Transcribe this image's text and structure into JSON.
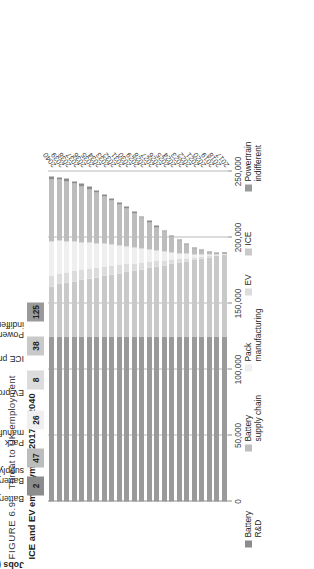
{
  "figure": {
    "number": "FIGURE 6.9",
    "title": "Threat to UK employment",
    "subtitle": "ICE and EV employment 2017 to 2040"
  },
  "value_header": "Jobs (000s) in 2040",
  "value_boxes": [
    {
      "label": "Battery R&D",
      "value": "2",
      "color": "#8c8c8c"
    },
    {
      "label": "Battery supply chain",
      "value": "47",
      "color": "#bdbdbd"
    },
    {
      "label": "Pack manufacturing",
      "value": "26",
      "color": "#efefef"
    },
    {
      "label": "EV production",
      "value": "8",
      "color": "#dcdcdc"
    },
    {
      "label": "ICE production",
      "value": "38",
      "color": "#c9c9c9"
    },
    {
      "label": "Powertrain indifferent",
      "value": "125",
      "color": "#9a9a9a"
    }
  ],
  "legend": [
    {
      "label": "Battery\nR&D",
      "color": "#8c8c8c"
    },
    {
      "label": "Battery\nsupply chain",
      "color": "#bdbdbd"
    },
    {
      "label": "Pack\nmanufacturing",
      "color": "#efefef"
    },
    {
      "label": "EV",
      "color": "#dcdcdc"
    },
    {
      "label": "ICE",
      "color": "#c9c9c9"
    },
    {
      "label": "Powertrain\nindifferent",
      "color": "#9a9a9a"
    }
  ],
  "chart_data": {
    "type": "bar",
    "orientation": "horizontal-stacked",
    "title": "ICE and EV employment 2017 to 2040",
    "xlabel": "",
    "ylabel": "",
    "ylim": [
      0,
      250000
    ],
    "yticks": [
      "0",
      "50,000",
      "100,000",
      "150,000",
      "200,000",
      "250,000"
    ],
    "ytick_values": [
      0,
      50000,
      100000,
      150000,
      200000,
      250000
    ],
    "grid": true,
    "legend_position": "bottom",
    "categories": [
      "2017",
      "2018",
      "2019",
      "2020",
      "2021",
      "2022",
      "2023",
      "2024",
      "2025",
      "2026",
      "2027",
      "2028",
      "2029",
      "2030",
      "2031",
      "2032",
      "2033",
      "2034",
      "2035",
      "2036",
      "2037",
      "2038",
      "2039",
      "2040"
    ],
    "series": [
      {
        "name": "Powertrain indifferent",
        "color": "#9a9a9a",
        "values": [
          125000,
          125000,
          125000,
          125000,
          125000,
          125000,
          125000,
          125000,
          125000,
          125000,
          125000,
          125000,
          125000,
          125000,
          125000,
          125000,
          125000,
          125000,
          125000,
          125000,
          125000,
          125000,
          125000,
          125000
        ]
      },
      {
        "name": "ICE",
        "color": "#c9c9c9",
        "values": [
          62000,
          61000,
          60000,
          59000,
          58000,
          57000,
          56000,
          55000,
          54000,
          53000,
          52000,
          51000,
          50000,
          49000,
          48000,
          47000,
          46000,
          45000,
          44000,
          43000,
          42000,
          41000,
          40000,
          38000
        ]
      },
      {
        "name": "EV",
        "color": "#dcdcdc",
        "values": [
          500,
          700,
          1000,
          1400,
          1900,
          2400,
          2900,
          3400,
          3900,
          4400,
          4800,
          5200,
          5600,
          6000,
          6300,
          6600,
          6900,
          7100,
          7300,
          7500,
          7700,
          7800,
          7900,
          8000
        ]
      },
      {
        "name": "Pack manufacturing",
        "color": "#efefef",
        "values": [
          300,
          500,
          900,
          1500,
          2300,
          3200,
          4300,
          5500,
          6800,
          8100,
          9400,
          10700,
          12000,
          13300,
          14600,
          15900,
          17200,
          18500,
          19800,
          21000,
          22200,
          23400,
          24600,
          26000
        ]
      },
      {
        "name": "Battery supply chain",
        "color": "#bdbdbd",
        "values": [
          400,
          900,
          1800,
          3100,
          4800,
          6900,
          9300,
          11900,
          14600,
          17400,
          20200,
          23000,
          25800,
          28500,
          31100,
          33600,
          36000,
          38200,
          40300,
          42200,
          43900,
          45200,
          46300,
          47000
        ]
      },
      {
        "name": "Battery R&D",
        "color": "#8c8c8c",
        "values": [
          200,
          300,
          400,
          500,
          600,
          700,
          800,
          900,
          1000,
          1100,
          1200,
          1300,
          1400,
          1500,
          1600,
          1700,
          1800,
          1900,
          2000,
          2000,
          2000,
          2000,
          2000,
          2000
        ]
      }
    ],
    "totals": [
      188400,
      188400,
      189100,
      190500,
      192600,
      195200,
      198300,
      201700,
      205300,
      209000,
      212600,
      216200,
      219800,
      223300,
      226600,
      229800,
      232900,
      235700,
      238400,
      240700,
      242800,
      244400,
      245800,
      246000
    ]
  }
}
